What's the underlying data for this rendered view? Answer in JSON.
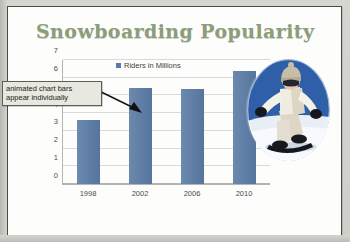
{
  "document": {
    "title": "Snowboarding Popularity"
  },
  "callout": {
    "line1": "animated chart bars",
    "line2": "appear individually"
  },
  "legend": {
    "label": "Riders in Millions"
  },
  "photo": {
    "alt_name": "snowboarder-photo",
    "sky_color": "#2f5fa8",
    "snow_color": "#e9eef5",
    "suit_color": "#ddd6c4"
  },
  "colors": {
    "bar": "#5b7ca6",
    "title": "#8d9d7b",
    "gridline": "#d9d9d6",
    "callout_bg": "#e8e8e0",
    "page": "#fdfdfb"
  },
  "chart_data": {
    "type": "bar",
    "title": "Snowboarding Popularity",
    "xlabel": "",
    "ylabel": "",
    "categories": [
      "1998",
      "2002",
      "2006",
      "2010"
    ],
    "values": [
      3.6,
      5.4,
      5.35,
      6.4
    ],
    "series": [
      {
        "name": "Riders in Millions",
        "values": [
          3.6,
          5.4,
          5.35,
          6.4
        ]
      }
    ],
    "ylim": [
      0,
      7
    ],
    "yticks": [
      0,
      1,
      2,
      3,
      4,
      5,
      6,
      7
    ],
    "ytick_labels": [
      "0",
      "1",
      "2",
      "3",
      "4",
      "5",
      "6",
      "7"
    ],
    "grid": true,
    "legend": "top-center",
    "legend_entries": [
      "Riders in Millions"
    ]
  }
}
